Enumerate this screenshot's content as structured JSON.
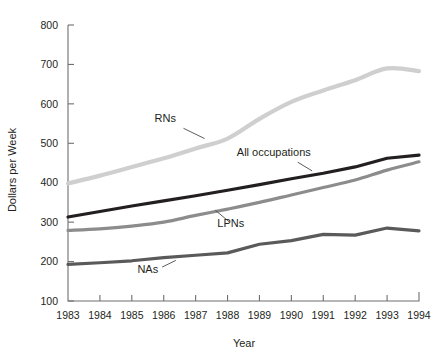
{
  "chart_data": {
    "type": "line",
    "title": "",
    "xlabel": "Year",
    "ylabel": "Dollars per Week",
    "x": [
      1983,
      1984,
      1985,
      1986,
      1987,
      1988,
      1989,
      1990,
      1991,
      1992,
      1993,
      1994
    ],
    "xtick_labels": [
      "1983",
      "1984",
      "1985",
      "1986",
      "1987",
      "1988",
      "1989",
      "1990",
      "1991",
      "1992",
      "1993",
      "1994"
    ],
    "ytick_labels": [
      "100",
      "200",
      "300",
      "400",
      "500",
      "600",
      "700",
      "800"
    ],
    "yticks": [
      100,
      200,
      300,
      400,
      500,
      600,
      700,
      800
    ],
    "xlim": [
      1983,
      1994
    ],
    "ylim": [
      100,
      800
    ],
    "grid": false,
    "legend": "inline-labels",
    "series": [
      {
        "name": "RNs",
        "label": "RNs",
        "color": "#cfcfcf",
        "width": 4.2,
        "label_x": 1986.05,
        "label_y": 553,
        "leader": [
          [
            1986.62,
            538
          ],
          [
            1987.28,
            512
          ]
        ],
        "values": [
          398,
          418,
          440,
          462,
          487,
          512,
          562,
          605,
          634,
          660,
          690,
          683
        ]
      },
      {
        "name": "All occupations",
        "label": "All occupations",
        "color": "#231f20",
        "width": 3.2,
        "label_x": 1989.45,
        "label_y": 468,
        "leader": [
          [
            1990.2,
            452
          ],
          [
            1990.65,
            430
          ]
        ],
        "values": [
          313,
          327,
          341,
          354,
          367,
          381,
          395,
          410,
          424,
          440,
          462,
          470
        ]
      },
      {
        "name": "LPNs",
        "label": "LPNs",
        "color": "#8c8c8c",
        "width": 3.2,
        "label_x": 1988.1,
        "label_y": 288,
        "leader": [
          [
            1988.05,
            301
          ],
          [
            1987.62,
            330
          ]
        ],
        "values": [
          279,
          283,
          290,
          300,
          317,
          333,
          350,
          369,
          388,
          407,
          432,
          453
        ]
      },
      {
        "name": "NAs",
        "label": "NAs",
        "color": "#5a5a5a",
        "width": 3.2,
        "label_x": 1985.5,
        "label_y": 172,
        "leader": [
          [
            1985.95,
            186
          ],
          [
            1986.38,
            203
          ]
        ],
        "values": [
          193,
          197,
          202,
          210,
          216,
          222,
          244,
          253,
          269,
          267,
          285,
          278
        ]
      }
    ]
  },
  "axes": {
    "y_title": "Dollars per Week",
    "x_title": "Year"
  }
}
